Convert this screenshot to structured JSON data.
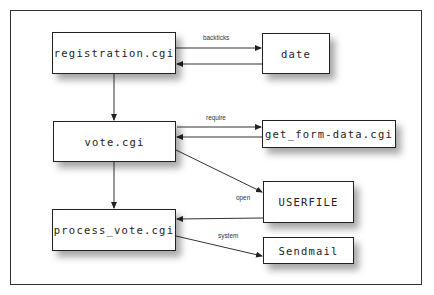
{
  "diagram": {
    "nodes": [
      {
        "id": "registration",
        "label": "registration.cgi"
      },
      {
        "id": "date",
        "label": "date"
      },
      {
        "id": "vote",
        "label": "vote.cgi"
      },
      {
        "id": "get_form_data",
        "label": "get_form-data.cgi"
      },
      {
        "id": "userfile",
        "label": "USERFILE"
      },
      {
        "id": "process_vote",
        "label": "process_vote.cgi"
      },
      {
        "id": "sendmail",
        "label": "Sendmail"
      }
    ],
    "edges": [
      {
        "from": "registration",
        "to": "date",
        "label": "backticks"
      },
      {
        "from": "date",
        "to": "registration",
        "label": ""
      },
      {
        "from": "registration",
        "to": "vote",
        "label": ""
      },
      {
        "from": "vote",
        "to": "get_form_data",
        "label": "require"
      },
      {
        "from": "get_form_data",
        "to": "vote",
        "label": ""
      },
      {
        "from": "vote",
        "to": "userfile",
        "label": "open"
      },
      {
        "from": "userfile",
        "to": "process_vote",
        "label": ""
      },
      {
        "from": "vote",
        "to": "process_vote",
        "label": ""
      },
      {
        "from": "process_vote",
        "to": "sendmail",
        "label": "system"
      }
    ]
  }
}
